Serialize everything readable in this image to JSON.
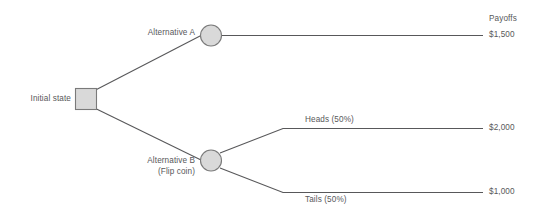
{
  "diagram": {
    "type": "decision-tree",
    "background_color": "#ffffff",
    "line_color": "#58585a",
    "node_fill_color": "#d9d9d9",
    "node_stroke_color": "#808080",
    "text_color": "#58585a"
  },
  "nodes": {
    "initial_state": {
      "label": "Initial state",
      "shape": "square"
    },
    "alternative_a": {
      "label": "Alternative A",
      "shape": "circle"
    },
    "alternative_b": {
      "label": "Alternative B",
      "sublabel": "(Flip coin)",
      "shape": "circle"
    }
  },
  "branches": {
    "heads": {
      "label": "Heads (50%)"
    },
    "tails": {
      "label": "Tails (50%)"
    }
  },
  "payoffs": {
    "header": "Payoffs",
    "alternative_a": "$1,500",
    "heads": "$2,000",
    "tails": "$1,000"
  }
}
